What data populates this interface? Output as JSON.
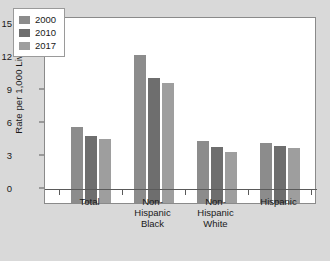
{
  "chart_data": {
    "type": "bar",
    "title": "",
    "xlabel": "",
    "ylabel": "Rate per 1,000 Live Births",
    "categories": [
      "Total",
      "Non-\nHispanic\nBlack",
      "Non-\nHispanic\nWhite",
      "Hispanic"
    ],
    "series": [
      {
        "name": "2000",
        "color": "#8c8c8c",
        "values": [
          6.9,
          13.5,
          5.6,
          5.5
        ]
      },
      {
        "name": "2010",
        "color": "#6e6e6e",
        "values": [
          6.1,
          11.4,
          5.1,
          5.2
        ]
      },
      {
        "name": "2017",
        "color": "#9e9e9e",
        "values": [
          5.8,
          10.9,
          4.6,
          5.0
        ]
      }
    ],
    "ylim": [
      0,
      15
    ],
    "yticks": [
      "0",
      "3",
      "6",
      "9",
      "12",
      "15"
    ],
    "grid": false,
    "legend_position": "top-left"
  },
  "colors": {
    "figure_background": "#d9d9d9",
    "panel_background": "#ffffff",
    "axis": "#5a5a5a",
    "text": "#1a1a1a"
  }
}
